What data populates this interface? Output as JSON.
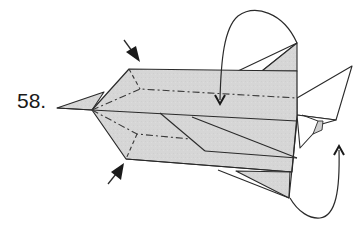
{
  "diagram": {
    "step_number": "58.",
    "type": "origami-fold-diagram",
    "colors": {
      "paper_fill": "#d6d6d6",
      "line": "#2a2a2a",
      "background": "#ffffff"
    },
    "symbols": [
      {
        "name": "push-arrow",
        "position": "top-left",
        "meaning": "squash/press inward"
      },
      {
        "name": "push-arrow",
        "position": "bottom-left",
        "meaning": "squash/press inward"
      },
      {
        "name": "mountain-fold-line",
        "position": "upper-body",
        "style": "dash-dot"
      },
      {
        "name": "mountain-fold-line",
        "position": "lower-body",
        "style": "dash-dot"
      },
      {
        "name": "fold-behind-arrow",
        "position": "top-right",
        "meaning": "fold flap over and down"
      },
      {
        "name": "fold-behind-arrow",
        "position": "bottom-right",
        "meaning": "fold flap around and up"
      }
    ]
  }
}
